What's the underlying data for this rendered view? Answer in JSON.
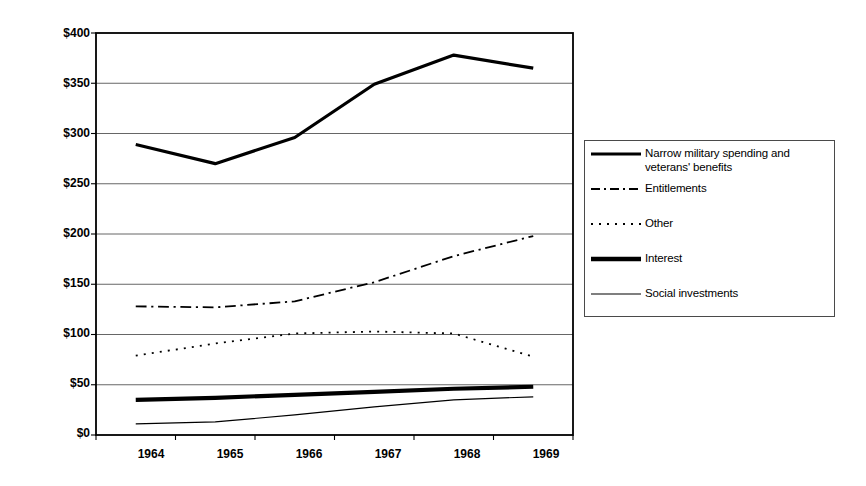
{
  "chart_data": {
    "type": "line",
    "title": "",
    "xlabel": "",
    "ylabel": "Constant 1992 dollars (in billions)",
    "x": [
      1964,
      1965,
      1966,
      1967,
      1968,
      1969
    ],
    "xtick_labels": [
      "1964",
      "1965",
      "1966",
      "1967",
      "1968",
      "1969"
    ],
    "ytick_labels": [
      "$0",
      "$50",
      "$100",
      "$150",
      "$200",
      "$250",
      "$300",
      "$350",
      "$400"
    ],
    "ytick_values": [
      0,
      50,
      100,
      150,
      200,
      250,
      300,
      350,
      400
    ],
    "ylim": [
      0,
      400
    ],
    "grid": "horizontal",
    "legend_position": "right-outside",
    "series": [
      {
        "name": "Narrow military spending and veterans' benefits",
        "style": "solid",
        "width": 3.2,
        "color": "#000000",
        "values": [
          289,
          270,
          296,
          349,
          378,
          365
        ]
      },
      {
        "name": "Entitlements",
        "style": "dash-dot",
        "width": 1.8,
        "color": "#000000",
        "values": [
          128,
          127,
          133,
          152,
          178,
          198
        ]
      },
      {
        "name": "Other",
        "style": "dotted",
        "width": 1.8,
        "color": "#000000",
        "values": [
          79,
          91,
          101,
          103,
          101,
          78
        ]
      },
      {
        "name": "Interest",
        "style": "solid",
        "width": 4.2,
        "color": "#000000",
        "values": [
          35,
          37,
          40,
          43,
          46,
          48
        ]
      },
      {
        "name": "Social investments",
        "style": "solid",
        "width": 1.2,
        "color": "#000000",
        "values": [
          11,
          13,
          20,
          28,
          35,
          38
        ]
      }
    ]
  },
  "legend": {
    "entries": [
      {
        "label": "Narrow military spending and veterans' benefits",
        "swatch": "solid-medium-line-icon"
      },
      {
        "label": "Entitlements",
        "swatch": "dash-dot-line-icon"
      },
      {
        "label": "Other",
        "swatch": "dotted-line-icon"
      },
      {
        "label": "Interest",
        "swatch": "solid-thick-line-icon"
      },
      {
        "label": "Social investments",
        "swatch": "solid-thin-line-icon"
      }
    ]
  },
  "axes": {
    "y_title": "Constant 1992 dollars (in billions)",
    "y_ticks": [
      "$400",
      "$350",
      "$300",
      "$250",
      "$200",
      "$150",
      "$100",
      "$50",
      "$0"
    ],
    "x_ticks": [
      "1964",
      "1965",
      "1966",
      "1967",
      "1968",
      "1969"
    ]
  }
}
